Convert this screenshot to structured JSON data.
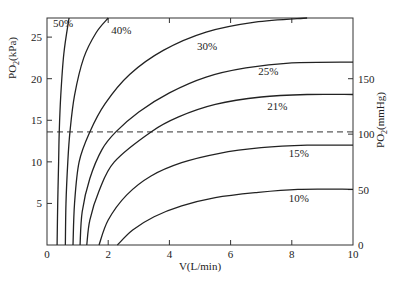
{
  "chart_data": {
    "type": "line",
    "title": "",
    "xlabel": "V(L/min)",
    "ylabel_left": "PO2(kPa)",
    "ylabel_right": "PO2(mmHg)",
    "xlim": [
      0,
      10
    ],
    "ylim_left": [
      0,
      27.3
    ],
    "ylim_right": [
      0,
      205
    ],
    "x_ticks": [
      0,
      2,
      4,
      6,
      8,
      10
    ],
    "y_ticks_left": [
      5,
      10,
      15,
      20,
      25
    ],
    "y_ticks_right": [
      0,
      50,
      100,
      150
    ],
    "grid": false,
    "reference_line": {
      "y_kpa": 13.6,
      "y_mmhg": 100,
      "style": "dashed"
    },
    "series": [
      {
        "name": "50%",
        "label_pos": [
          0.2,
          26.2
        ],
        "points": [
          [
            0.33,
            0
          ],
          [
            0.35,
            5
          ],
          [
            0.38,
            10
          ],
          [
            0.4,
            13.6
          ],
          [
            0.45,
            18
          ],
          [
            0.55,
            23
          ],
          [
            0.72,
            27.3
          ]
        ]
      },
      {
        "name": "40%",
        "label_pos": [
          2.1,
          25.4
        ],
        "points": [
          [
            0.6,
            0
          ],
          [
            0.62,
            5
          ],
          [
            0.68,
            10
          ],
          [
            0.75,
            13.6
          ],
          [
            0.9,
            18
          ],
          [
            1.2,
            22.5
          ],
          [
            1.6,
            25.5
          ],
          [
            2.0,
            27.3
          ]
        ]
      },
      {
        "name": "30%",
        "label_pos": [
          4.9,
          23.4
        ],
        "points": [
          [
            0.85,
            0
          ],
          [
            0.9,
            5
          ],
          [
            1.05,
            10
          ],
          [
            1.4,
            13.6
          ],
          [
            1.9,
            17
          ],
          [
            2.7,
            20.5
          ],
          [
            3.8,
            23.4
          ],
          [
            5.2,
            25.6
          ],
          [
            6.8,
            26.8
          ],
          [
            8.5,
            27.3
          ]
        ]
      },
      {
        "name": "25%",
        "label_pos": [
          6.9,
          20.4
        ],
        "points": [
          [
            1.08,
            0
          ],
          [
            1.15,
            4
          ],
          [
            1.4,
            8
          ],
          [
            1.8,
            11.5
          ],
          [
            2.25,
            13.6
          ],
          [
            3.0,
            16
          ],
          [
            4.0,
            18.3
          ],
          [
            5.2,
            20.2
          ],
          [
            6.5,
            21.3
          ],
          [
            8.0,
            21.9
          ],
          [
            10,
            22.0
          ]
        ]
      },
      {
        "name": "21%",
        "label_pos": [
          7.2,
          16.2
        ],
        "points": [
          [
            1.3,
            0
          ],
          [
            1.4,
            3
          ],
          [
            1.7,
            6.5
          ],
          [
            2.2,
            10
          ],
          [
            3.4,
            13.6
          ],
          [
            4.3,
            15.4
          ],
          [
            5.5,
            16.9
          ],
          [
            7.0,
            17.8
          ],
          [
            8.5,
            18.1
          ],
          [
            10,
            18.1
          ]
        ]
      },
      {
        "name": "15%",
        "label_pos": [
          7.9,
          10.6
        ],
        "points": [
          [
            1.7,
            0
          ],
          [
            2.0,
            3
          ],
          [
            2.6,
            6
          ],
          [
            3.4,
            8.3
          ],
          [
            4.4,
            9.9
          ],
          [
            5.6,
            11.0
          ],
          [
            7.0,
            11.7
          ],
          [
            8.5,
            12.0
          ],
          [
            10,
            12.0
          ]
        ]
      },
      {
        "name": "10%",
        "label_pos": [
          7.9,
          5.2
        ],
        "points": [
          [
            2.3,
            0
          ],
          [
            2.8,
            1.8
          ],
          [
            3.5,
            3.4
          ],
          [
            4.4,
            4.7
          ],
          [
            5.5,
            5.7
          ],
          [
            6.8,
            6.3
          ],
          [
            8.2,
            6.7
          ],
          [
            10,
            6.7
          ]
        ]
      }
    ]
  },
  "caption": ""
}
